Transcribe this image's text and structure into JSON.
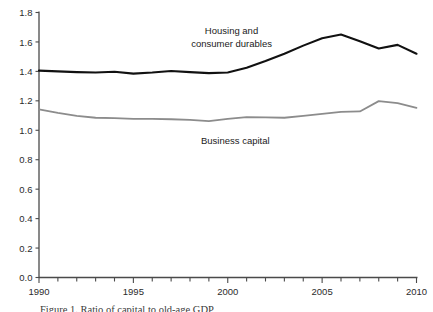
{
  "chart_data": {
    "type": "line",
    "title": "",
    "xlabel": "",
    "ylabel": "",
    "xlim": [
      1990,
      2010
    ],
    "ylim": [
      0.0,
      1.8
    ],
    "x": [
      1990,
      1991,
      1992,
      1993,
      1994,
      1995,
      1996,
      1997,
      1998,
      1999,
      2000,
      2001,
      2002,
      2003,
      2004,
      2005,
      2006,
      2007,
      2008,
      2009,
      2010
    ],
    "yticks": [
      "0.0",
      "0.2",
      "0.4",
      "0.6",
      "0.8",
      "1.0",
      "1.2",
      "1.4",
      "1.6",
      "1.8"
    ],
    "ytick_values": [
      0.0,
      0.2,
      0.4,
      0.6,
      0.8,
      1.0,
      1.2,
      1.4,
      1.6,
      1.8
    ],
    "xticks": [
      "1990",
      "1995",
      "2000",
      "2005",
      "2010"
    ],
    "xtick_values": [
      1990,
      1995,
      2000,
      2005,
      2010
    ],
    "xminor_step": 1,
    "grid": false,
    "legend": "inline-annotations",
    "series": [
      {
        "name": "Housing and consumer durables",
        "color": "#111111",
        "width": 2.1,
        "values": [
          1.405,
          1.4,
          1.395,
          1.392,
          1.398,
          1.385,
          1.392,
          1.403,
          1.395,
          1.388,
          1.392,
          1.425,
          1.47,
          1.52,
          1.575,
          1.625,
          1.65,
          1.605,
          1.555,
          1.58,
          1.52
        ]
      },
      {
        "name": "Business capital",
        "color": "#8c8c8c",
        "width": 1.8,
        "values": [
          1.142,
          1.118,
          1.098,
          1.085,
          1.082,
          1.078,
          1.078,
          1.075,
          1.07,
          1.062,
          1.078,
          1.09,
          1.088,
          1.085,
          1.098,
          1.112,
          1.125,
          1.128,
          1.198,
          1.185,
          1.152
        ]
      }
    ],
    "annotations": [
      {
        "text": "Housing and",
        "x": 2000.2,
        "y": 1.655
      },
      {
        "text": "consumer durables",
        "x": 2000.2,
        "y": 1.565
      },
      {
        "text": "Business capital",
        "x": 2000.4,
        "y": 0.905
      }
    ],
    "caption": "Figure 1. Ratio of capital to old-age GDP"
  },
  "axis": {
    "y_axis_name": "value-axis",
    "x_axis_name": "year-axis"
  }
}
